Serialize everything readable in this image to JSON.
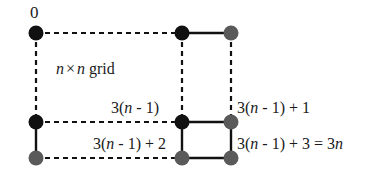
{
  "figure": {
    "name": "grid-graph-labeling-diagram",
    "background_color": "#ffffff",
    "width": 374,
    "height": 180
  },
  "colors": {
    "black_node": "#111111",
    "gray_node": "#5a5a5a",
    "edge": "#111111",
    "text": "#1a1a1a"
  },
  "labels": {
    "origin": "0",
    "grid_prefix": "n",
    "grid_times": "×",
    "grid_suffix": "n",
    "grid_word": "grid",
    "grid_full": "n × n grid",
    "left_middle": "3(",
    "vertex_3n_minus_1": "3(n - 1)",
    "vertex_3n_minus_1_plus_1": "3(n - 1) + 1",
    "vertex_3n_minus_1_plus_2": "3(n - 1) + 2",
    "vertex_3n_minus_1_plus_3": "3(n - 1) + 3 = 3n"
  },
  "label_parts": {
    "a_pre": "3(",
    "a_var": "n",
    "a_post": " - 1)",
    "b_pre": "3(",
    "b_var": "n",
    "b_post": " - 1) + 1",
    "c_pre": "3(",
    "c_var": "n",
    "c_post": " - 1) + 2",
    "d_pre": "3(",
    "d_var": "n",
    "d_post": " - 1) + 3 = 3",
    "d_var2": "n"
  },
  "nodes": [
    {
      "id": "n-top-left",
      "x": 36,
      "y": 33,
      "fill": "black",
      "r": 7.5,
      "label": "0"
    },
    {
      "id": "n-top-mid",
      "x": 182,
      "y": 33,
      "fill": "black",
      "r": 7.5,
      "label": ""
    },
    {
      "id": "n-top-right",
      "x": 231,
      "y": 33,
      "fill": "gray",
      "r": 7.5,
      "label": ""
    },
    {
      "id": "n-mid-left",
      "x": 36,
      "y": 122,
      "fill": "black",
      "r": 7.5,
      "label": ""
    },
    {
      "id": "n-mid-mid",
      "x": 182,
      "y": 122,
      "fill": "black",
      "r": 7.5,
      "label": "3(n - 1)"
    },
    {
      "id": "n-mid-right",
      "x": 231,
      "y": 122,
      "fill": "gray",
      "r": 7.5,
      "label": "3(n - 1) + 1"
    },
    {
      "id": "n-bot-left",
      "x": 36,
      "y": 158,
      "fill": "gray",
      "r": 7.5,
      "label": ""
    },
    {
      "id": "n-bot-mid",
      "x": 182,
      "y": 158,
      "fill": "gray",
      "r": 7.5,
      "label": "3(n - 1) + 2"
    },
    {
      "id": "n-bot-right",
      "x": 231,
      "y": 158,
      "fill": "gray",
      "r": 7.5,
      "label": "3(n - 1) + 3 = 3n"
    }
  ],
  "edges": [
    {
      "id": "e-top-horizontal-dashed",
      "from": "n-top-left",
      "to": "n-top-mid",
      "style": "dashed"
    },
    {
      "id": "e-top-right-solid",
      "from": "n-top-mid",
      "to": "n-top-right",
      "style": "solid"
    },
    {
      "id": "e-left-vertical-dashed",
      "from": "n-top-left",
      "to": "n-mid-left",
      "style": "dashed"
    },
    {
      "id": "e-midcol-vertical-dashed",
      "from": "n-top-mid",
      "to": "n-mid-mid",
      "style": "dashed"
    },
    {
      "id": "e-rightcol-vert-dashed",
      "from": "n-top-right",
      "to": "n-mid-right",
      "style": "dashed"
    },
    {
      "id": "e-mid-horizontal-dashed",
      "from": "n-mid-left",
      "to": "n-mid-mid",
      "style": "dashed"
    },
    {
      "id": "e-mid-right-solid",
      "from": "n-mid-mid",
      "to": "n-mid-right",
      "style": "solid"
    },
    {
      "id": "e-left-lower-solid",
      "from": "n-mid-left",
      "to": "n-bot-left",
      "style": "solid"
    },
    {
      "id": "e-bottom-horiz-dashed",
      "from": "n-bot-left",
      "to": "n-bot-mid",
      "style": "dashed"
    },
    {
      "id": "e-midcol-lower-solid",
      "from": "n-mid-mid",
      "to": "n-bot-mid",
      "style": "solid"
    },
    {
      "id": "e-rightcol-lower-solid",
      "from": "n-mid-right",
      "to": "n-bot-right",
      "style": "solid"
    },
    {
      "id": "e-bottom-right-solid",
      "from": "n-bot-mid",
      "to": "n-bot-right",
      "style": "solid"
    }
  ]
}
